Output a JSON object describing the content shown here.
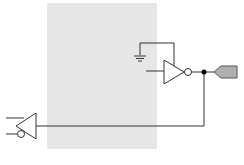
{
  "diagram": {
    "type": "schematic",
    "colors": {
      "background": "#ffffff",
      "region_fill": "#e6e6e6",
      "wire": "#333333",
      "connector_fill": "#b0b0b0",
      "junction": "#000000"
    },
    "region": {
      "x": 47,
      "y": 3,
      "width": 110,
      "height": 146
    },
    "components": [
      {
        "id": "tristate-output-buffer",
        "kind": "inverting buffer with enable",
        "x": 165,
        "y": 71
      },
      {
        "id": "input-buffer",
        "kind": "buffer with inverted enable",
        "x": 18,
        "y": 126
      },
      {
        "id": "ground",
        "kind": "ground symbol",
        "x": 138,
        "y": 57
      },
      {
        "id": "io-pad",
        "kind": "bidirectional port connector",
        "x": 216,
        "y": 71
      },
      {
        "id": "junction",
        "kind": "net junction dot",
        "x": 204,
        "y": 71
      }
    ]
  }
}
